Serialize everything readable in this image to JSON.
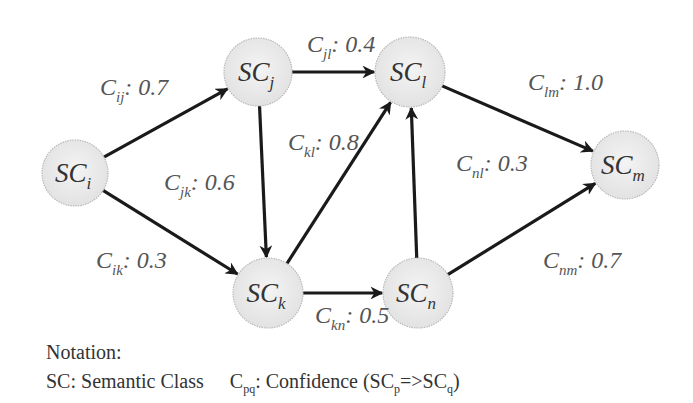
{
  "diagram": {
    "nodes": [
      {
        "id": "i",
        "base": "SC",
        "sub": "i",
        "cx": 75,
        "cy": 173,
        "r": 33
      },
      {
        "id": "j",
        "base": "SC",
        "sub": "j",
        "cx": 258,
        "cy": 72,
        "r": 34
      },
      {
        "id": "l",
        "base": "SC",
        "sub": "l",
        "cx": 410,
        "cy": 72,
        "r": 35
      },
      {
        "id": "m",
        "base": "SC",
        "sub": "m",
        "cx": 625,
        "cy": 165,
        "r": 34
      },
      {
        "id": "k",
        "base": "SC",
        "sub": "k",
        "cx": 268,
        "cy": 293,
        "r": 35
      },
      {
        "id": "n",
        "base": "SC",
        "sub": "n",
        "cx": 418,
        "cy": 293,
        "r": 35
      }
    ],
    "edges": [
      {
        "from": "i",
        "to": "j",
        "label_base": "C",
        "label_sub": "ij",
        "value": "0.7",
        "lx": 100,
        "ly": 95
      },
      {
        "from": "i",
        "to": "k",
        "label_base": "C",
        "label_sub": "ik",
        "value": "0.3",
        "lx": 96,
        "ly": 268
      },
      {
        "from": "j",
        "to": "l",
        "label_base": "C",
        "label_sub": "jl",
        "value": "0.4",
        "lx": 307,
        "ly": 52
      },
      {
        "from": "j",
        "to": "k",
        "label_base": "C",
        "label_sub": "jk",
        "value": "0.6",
        "lx": 164,
        "ly": 190
      },
      {
        "from": "k",
        "to": "l",
        "label_base": "C",
        "label_sub": "kl",
        "value": "0.8",
        "lx": 288,
        "ly": 150
      },
      {
        "from": "k",
        "to": "n",
        "label_base": "C",
        "label_sub": "kn",
        "value": "0.5",
        "lx": 315,
        "ly": 323
      },
      {
        "from": "n",
        "to": "l",
        "label_base": "C",
        "label_sub": "nl",
        "value": "0.3",
        "lx": 456,
        "ly": 171
      },
      {
        "from": "l",
        "to": "m",
        "label_base": "C",
        "label_sub": "lm",
        "value": "1.0",
        "lx": 528,
        "ly": 90
      },
      {
        "from": "n",
        "to": "m",
        "label_base": "C",
        "label_sub": "nm",
        "value": "0.7",
        "lx": 543,
        "ly": 268
      }
    ],
    "colors": {
      "node_fill": "#ececec",
      "node_stroke": "#b8b8b8",
      "edge": "#1a1a1a"
    }
  },
  "notation": {
    "title": "Notation:",
    "sc_def": "SC: Semantic Class",
    "c_base": "C",
    "c_sub": "pq",
    "c_def_prefix": ": Confidence (SC",
    "c_def_p": "p",
    "c_def_arrow": "=>SC",
    "c_def_q": "q",
    "c_def_suffix": ")"
  }
}
